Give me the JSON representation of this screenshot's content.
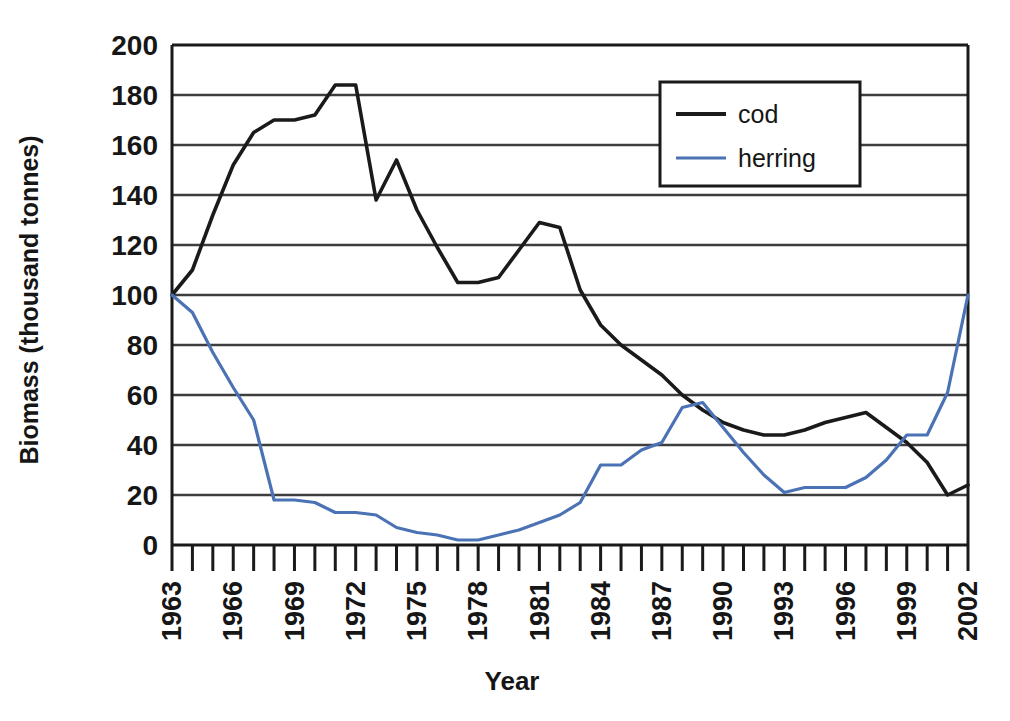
{
  "chart_data": {
    "type": "line",
    "title": "",
    "xlabel": "Year",
    "ylabel": "Biomass (thousand tonnes)",
    "xlim": [
      1963,
      2002
    ],
    "ylim": [
      0,
      200
    ],
    "ytick_step": 20,
    "xtick_step": 1,
    "xtick_label_step": 3,
    "grid": "horizontal",
    "legend_position": "top-right",
    "yticks": [
      200,
      180,
      160,
      140,
      120,
      100,
      80,
      60,
      40,
      20,
      0
    ],
    "x": [
      1963,
      1964,
      1965,
      1966,
      1967,
      1968,
      1969,
      1970,
      1971,
      1972,
      1973,
      1974,
      1975,
      1976,
      1977,
      1978,
      1979,
      1980,
      1981,
      1982,
      1983,
      1984,
      1985,
      1986,
      1987,
      1988,
      1989,
      1990,
      1991,
      1992,
      1993,
      1994,
      1995,
      1996,
      1997,
      1998,
      1999,
      2000,
      2001,
      2002
    ],
    "xtick_labels": [
      "1963",
      "",
      "",
      "1966",
      "",
      "",
      "1969",
      "",
      "",
      "1972",
      "",
      "",
      "1975",
      "",
      "",
      "1978",
      "",
      "",
      "1981",
      "",
      "",
      "1984",
      "",
      "",
      "1987",
      "",
      "",
      "1990",
      "",
      "",
      "1993",
      "",
      "",
      "1996",
      "",
      "",
      "1999",
      "",
      "",
      "2002"
    ],
    "series": [
      {
        "name": "cod",
        "color": "#1a1a1a",
        "values": [
          100,
          110,
          132,
          152,
          165,
          170,
          170,
          172,
          184,
          184,
          138,
          154,
          134,
          119,
          105,
          105,
          107,
          118,
          129,
          127,
          102,
          88,
          80,
          74,
          68,
          60,
          54,
          49,
          46,
          44,
          44,
          46,
          49,
          51,
          53,
          47,
          41,
          33,
          20,
          24
        ]
      },
      {
        "name": "herring",
        "color": "#4a72b5",
        "values": [
          100,
          93,
          77,
          63,
          50,
          18,
          18,
          17,
          13,
          13,
          12,
          7,
          5,
          4,
          2,
          2,
          4,
          6,
          9,
          12,
          17,
          32,
          32,
          38,
          41,
          55,
          57,
          47,
          37,
          28,
          21,
          23,
          23,
          23,
          27,
          34,
          44,
          44,
          61,
          100
        ]
      }
    ]
  },
  "legend": {
    "items": [
      {
        "label": "cod",
        "color": "#1a1a1a"
      },
      {
        "label": "herring",
        "color": "#4a72b5"
      }
    ]
  },
  "axes": {
    "y_title": "Biomass (thousand tonnes)",
    "x_title": "Year"
  }
}
